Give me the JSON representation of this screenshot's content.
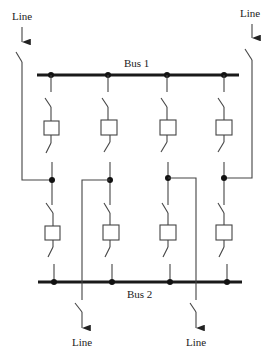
{
  "diagram": {
    "type": "breaker-and-a-half / double-bus switching arrangement",
    "buses": [
      {
        "id": "bus1",
        "label": "Bus 1"
      },
      {
        "id": "bus2",
        "label": "Bus 2"
      }
    ],
    "lines": [
      {
        "id": "line-top-left",
        "label": "Line",
        "direction": "in"
      },
      {
        "id": "line-top-right",
        "label": "Line",
        "direction": "in"
      },
      {
        "id": "line-bottom-left",
        "label": "Line",
        "direction": "out"
      },
      {
        "id": "line-bottom-right",
        "label": "Line",
        "direction": "out"
      }
    ],
    "bays": 4,
    "breakers_per_bay": 2,
    "disconnect_switches_per_bay": 4
  },
  "colors": {
    "bus": "#1a1a1a",
    "wire": "#444444",
    "background": "#ffffff"
  }
}
